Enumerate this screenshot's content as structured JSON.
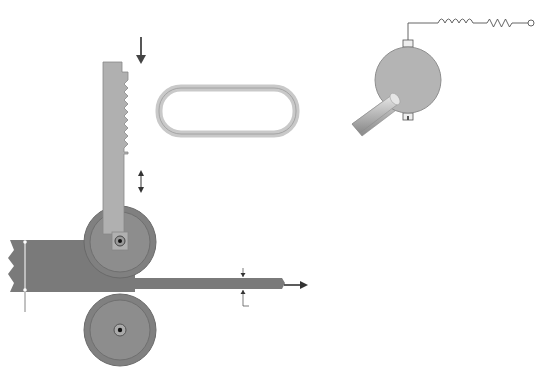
{
  "diagram": {
    "colors": {
      "gear": "#8a8a8a",
      "gear_dark": "#6e6e6e",
      "rack": "#b0b0b0",
      "material": "#7a7a7a",
      "roller_outer": "#808080",
      "roller_inner": "#8d8d8d",
      "motor": "#b4b4b4",
      "wire": "#555555",
      "text": "#2a2a2a"
    },
    "labels": {
      "force": "F",
      "force_sub": "m",
      "rack_pinion_line1": "Rack and",
      "rack_pinion_line2": "Pinion",
      "gear_ratio_line1": "1 : N",
      "gear_ratio_line2": "Gear ratio",
      "adjustable_roller_line1": "Vertically",
      "adjustable_roller_line2": "adjustable",
      "adjustable_roller_line3": "roller",
      "fixed_roller_line1": "Fixed",
      "fixed_roller_line2": "roller",
      "thickness_in": "Thickness T",
      "thickness_out": "Thickness x",
      "motion_line1": "Motion of",
      "motion_line2": "material",
      "motion_line3": "out of rollers"
    },
    "circuit": {
      "inductor": "L",
      "inductor_sub": "a",
      "resistor": "R",
      "resistor_sub": "a",
      "current": "i",
      "current_sub": "a",
      "current_arg": "(t)",
      "motor_voltage": "v",
      "motor_voltage_sub": "a",
      "motor_voltage_arg": "(t)",
      "source_voltage": "v",
      "source_voltage_sub": "s",
      "source_voltage_arg": "(t)",
      "plus": "+",
      "minus": "−"
    }
  }
}
